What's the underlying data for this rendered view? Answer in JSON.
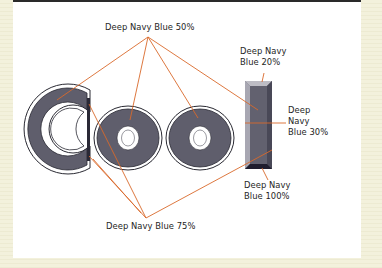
{
  "figure": {
    "word": "CooI",
    "letters": [
      "C",
      "o",
      "o",
      "I"
    ],
    "colors": {
      "background": "#f3f1dc",
      "panel": "#ffffff",
      "fill": "#5f5e6c",
      "fill_dark": "#1f1d2e",
      "fill_light": "#bdbcc4",
      "outline": "#2a2a33",
      "leader_lines": "#d9692a"
    }
  },
  "labels": {
    "top": "Deep Navy Blue 50%",
    "bottom": "Deep Navy Blue 75%",
    "bar_top_line1": "Deep Navy",
    "bar_top_line2": "Blue 20%",
    "bar_mid_line1": "Deep",
    "bar_mid_line2": "Navy",
    "bar_mid_line3": "Blue 30%",
    "bar_bottom_line1": "Deep Navy",
    "bar_bottom_line2": "Blue 100%"
  }
}
